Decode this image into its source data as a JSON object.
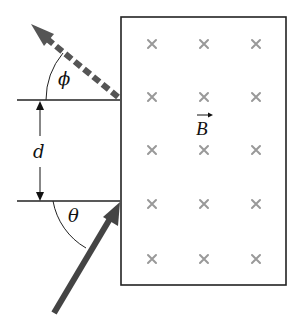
{
  "diagram": {
    "type": "physics-magnetic-field-region",
    "labels": {
      "phi": "ϕ",
      "theta": "θ",
      "distance": "d",
      "field": "B"
    },
    "field": {
      "direction": "into-page",
      "symbol": "×",
      "rows": 5,
      "cols": 3,
      "color": "#999999"
    },
    "region": {
      "x": 121,
      "y": 17,
      "width": 165,
      "height": 268,
      "border_color": "#222222"
    },
    "incoming_particle": {
      "style": "solid",
      "color": "#444444",
      "from": [
        54,
        313
      ],
      "to": [
        120,
        202
      ],
      "angle_label": "θ"
    },
    "outgoing_particle": {
      "style": "dashed",
      "color": "#555555",
      "from": [
        120,
        98
      ],
      "to": [
        31,
        24
      ],
      "angle_label": "ϕ"
    },
    "separation": {
      "label": "d",
      "top_y": 100,
      "bottom_y": 201
    }
  }
}
